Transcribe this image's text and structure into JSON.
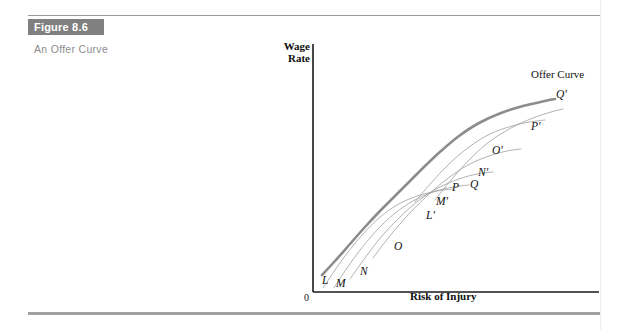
{
  "figure": {
    "tag": "Figure 8.6",
    "caption": "An Offer Curve"
  },
  "colors": {
    "tag_background": "#808080",
    "tag_text": "#ffffff",
    "caption_text": "#8d8d8d",
    "offer_curve": "#8c8c8c",
    "indifference_curve": "#9e9e9e",
    "axis": "#1a1a1a",
    "rule_top": "#9a9a9a",
    "rule_bottom": "#a2a2a2",
    "background": "#ffffff"
  },
  "chart_data": {
    "type": "line",
    "title": "An Offer Curve",
    "xlabel": "Risk of Injury",
    "ylabel": "Wage Rate",
    "origin_label": "0",
    "grid": false,
    "legend": "none",
    "axis_origin_px": [
      58,
      262
    ],
    "series": [
      {
        "name": "Offer Curve",
        "role": "offer-curve",
        "label": "Offer Curve",
        "endpoint_label": "Q'",
        "points": [
          [
            67,
            245
          ],
          [
            80,
            231
          ],
          [
            95,
            214
          ],
          [
            110,
            197
          ],
          [
            124,
            182
          ],
          [
            139,
            167
          ],
          [
            154,
            152
          ],
          [
            170,
            136
          ],
          [
            186,
            121
          ],
          [
            204,
            106
          ],
          [
            224,
            93
          ],
          [
            246,
            83
          ],
          [
            268,
            76
          ],
          [
            290,
            71
          ],
          [
            300,
            69
          ]
        ]
      },
      {
        "name": "Indifference Curve L-L'",
        "role": "indifference-curve",
        "start_label": "L",
        "end_label": "L'",
        "points": [
          [
            68,
            258
          ],
          [
            80,
            240
          ],
          [
            93,
            222
          ],
          [
            108,
            204
          ],
          [
            124,
            188
          ],
          [
            142,
            175
          ],
          [
            162,
            166
          ],
          [
            182,
            161
          ],
          [
            198,
            159
          ]
        ]
      },
      {
        "name": "Indifference Curve M-M'",
        "role": "indifference-curve",
        "start_label": "M",
        "end_label": "M'",
        "points": [
          [
            79,
            258
          ],
          [
            92,
            238
          ],
          [
            106,
            219
          ],
          [
            122,
            200
          ],
          [
            139,
            184
          ],
          [
            158,
            171
          ],
          [
            178,
            162
          ],
          [
            198,
            157
          ],
          [
            214,
            155
          ]
        ]
      },
      {
        "name": "Indifference Curve N-N'",
        "role": "indifference-curve",
        "start_label": "N",
        "end_label": "N'",
        "points": [
          [
            95,
            249
          ],
          [
            110,
            228
          ],
          [
            126,
            207
          ],
          [
            144,
            188
          ],
          [
            163,
            171
          ],
          [
            183,
            158
          ],
          [
            204,
            149
          ],
          [
            222,
            144
          ],
          [
            238,
            142
          ]
        ]
      },
      {
        "name": "Indifference Curve O-O'",
        "role": "indifference-curve",
        "start_label": "O",
        "end_label": "O'",
        "points": [
          [
            118,
            228
          ],
          [
            134,
            207
          ],
          [
            152,
            186
          ],
          [
            172,
            166
          ],
          [
            192,
            149
          ],
          [
            213,
            135
          ],
          [
            234,
            126
          ],
          [
            252,
            121
          ],
          [
            266,
            119
          ]
        ]
      },
      {
        "name": "Indifference Curve P-P'",
        "role": "indifference-curve",
        "start_label": "P",
        "end_label": "P'",
        "points": [
          [
            160,
            172
          ],
          [
            176,
            153
          ],
          [
            194,
            134
          ],
          [
            214,
            117
          ],
          [
            235,
            104
          ],
          [
            257,
            96
          ],
          [
            275,
            92
          ],
          [
            290,
            90
          ]
        ]
      },
      {
        "name": "Indifference Curve Q-Q'",
        "role": "indifference-curve",
        "start_label": "Q",
        "end_label": "Q'",
        "points": [
          [
            180,
            170
          ],
          [
            196,
            150
          ],
          [
            214,
            130
          ],
          [
            234,
            112
          ],
          [
            256,
            98
          ],
          [
            278,
            88
          ],
          [
            296,
            82
          ],
          [
            308,
            79
          ]
        ]
      }
    ],
    "point_labels": [
      {
        "text": "L",
        "x": 322,
        "y": 274
      },
      {
        "text": "M",
        "x": 336,
        "y": 277
      },
      {
        "text": "N",
        "x": 360,
        "y": 265
      },
      {
        "text": "O",
        "x": 394,
        "y": 240
      },
      {
        "text": "P",
        "x": 452,
        "y": 181
      },
      {
        "text": "Q",
        "x": 470,
        "y": 178
      },
      {
        "text": "L'",
        "x": 426,
        "y": 209
      },
      {
        "text": "M'",
        "x": 436,
        "y": 195
      },
      {
        "text": "N'",
        "x": 478,
        "y": 166
      },
      {
        "text": "O'",
        "x": 492,
        "y": 144
      },
      {
        "text": "P'",
        "x": 531,
        "y": 120
      },
      {
        "text": "Q'",
        "x": 556,
        "y": 88
      }
    ],
    "annotations": [
      {
        "text": "Offer Curve",
        "x": 531,
        "y": 68
      }
    ]
  }
}
